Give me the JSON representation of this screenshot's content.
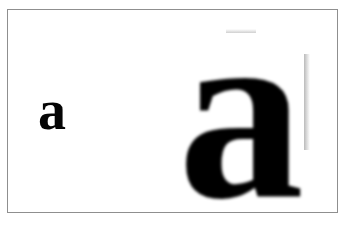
{
  "figure": {
    "kind": "glyph-magnification-illustration",
    "background_color": "#ffffff",
    "panel": {
      "border_color": "#8f8f8f",
      "border_width_px": 1,
      "fill_color": "#ffffff"
    },
    "glyphs": {
      "small": {
        "character": "a",
        "label": "small-serif-a",
        "color": "#050505",
        "style": "serif, double-storey, bold, sharply rendered"
      },
      "large": {
        "character": "a",
        "label": "magnified-serif-a",
        "color": "#040404",
        "style": "serif, double-storey, bold, magnified with visible pixelation and blur"
      }
    },
    "artifacts": {
      "stem_halo_color": "#828282",
      "top_speckle_color": "#969696"
    }
  }
}
